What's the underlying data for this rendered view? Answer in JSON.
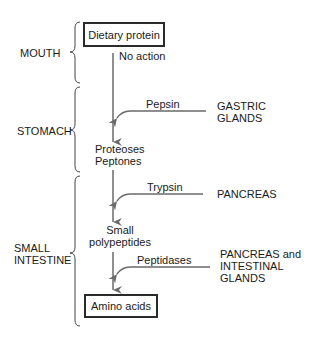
{
  "diagram": {
    "type": "flowchart",
    "colors": {
      "line": "#6a6a6a",
      "text": "#1a1a1a",
      "box_border": "#2a2a2a"
    },
    "regions": [
      {
        "id": "mouth",
        "label": "MOUTH"
      },
      {
        "id": "stomach",
        "label": "STOMACH"
      },
      {
        "id": "small_intestine",
        "label_line1": "SMALL",
        "label_line2": "INTESTINE"
      }
    ],
    "nodes": {
      "start": "Dietary protein",
      "stage1_line1": "Proteoses",
      "stage1_line2": "Peptones",
      "stage2_line1": "Small",
      "stage2_line2": "polypeptides",
      "end": "Amino acids"
    },
    "steps": [
      {
        "enzyme": "No action"
      },
      {
        "enzyme": "Pepsin",
        "source_line1": "GASTRIC",
        "source_line2": "GLANDS"
      },
      {
        "enzyme": "Trypsin",
        "source_line1": "PANCREAS"
      },
      {
        "enzyme": "Peptidases",
        "source_line1": "PANCREAS and",
        "source_line2": "INTESTINAL",
        "source_line3": "GLANDS"
      }
    ]
  }
}
